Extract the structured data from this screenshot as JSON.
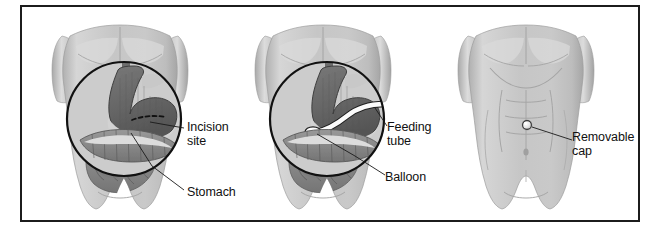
{
  "figure": {
    "panel_count": 3,
    "border_color": "#1c1c1c",
    "background_color": "#ffffff"
  },
  "palette": {
    "skin_light": "#cfcfcf",
    "skin_mid": "#b9b9b9",
    "skin_shadow": "#9f9f9f",
    "skin_highlight": "#e4e4e4",
    "stomach_dark": "#6a6a6a",
    "stomach_shade": "#5a5a5a",
    "intestine_gray": "#8d8d8d",
    "intestine_dark": "#6f6f6f",
    "tube_white": "#fdfdfd",
    "outline": "#1c1c1c",
    "magnifier_ring": "#111111",
    "leader_line": "#1a1a1a",
    "cap_white": "#f4f4f4"
  },
  "panels": [
    {
      "id": "panel-1",
      "name": "incision-panel",
      "description": "Torso with magnified view of stomach and dashed incision line",
      "has_magnifier": true,
      "labels": [
        {
          "id": "incision-site",
          "text": "Incision\nsite"
        },
        {
          "id": "stomach",
          "text": "Stomach"
        }
      ]
    },
    {
      "id": "panel-2",
      "name": "feeding-tube-panel",
      "description": "Torso with magnified view of feeding tube inserted into stomach with balloon",
      "has_magnifier": true,
      "labels": [
        {
          "id": "feeding-tube",
          "text": "Feeding\ntube"
        },
        {
          "id": "balloon",
          "text": "Balloon"
        }
      ]
    },
    {
      "id": "panel-3",
      "name": "removable-cap-panel",
      "description": "Torso exterior showing removable cap on abdomen",
      "has_magnifier": false,
      "labels": [
        {
          "id": "removable-cap",
          "text": "Removable\ncap"
        }
      ]
    }
  ],
  "labels": {
    "incision_site": "Incision\nsite",
    "stomach": "Stomach",
    "feeding_tube": "Feeding\ntube",
    "balloon": "Balloon",
    "removable_cap": "Removable\ncap"
  }
}
